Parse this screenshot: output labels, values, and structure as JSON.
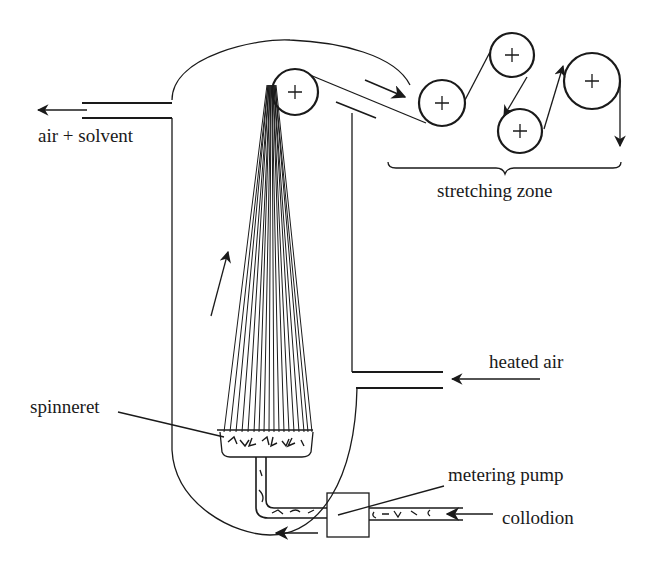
{
  "labels": {
    "air_solvent": "air + solvent",
    "stretching_zone": "stretching zone",
    "heated_air": "heated air",
    "spinneret": "spinneret",
    "metering_pump": "metering pump",
    "collodion": "collodion"
  },
  "components": {
    "vessel": "spinning column",
    "guide_roller": "take-up roller",
    "stretch_rollers": 4,
    "filaments": 18
  },
  "colors": {
    "line": "#1a1a1a",
    "background": "#ffffff"
  }
}
